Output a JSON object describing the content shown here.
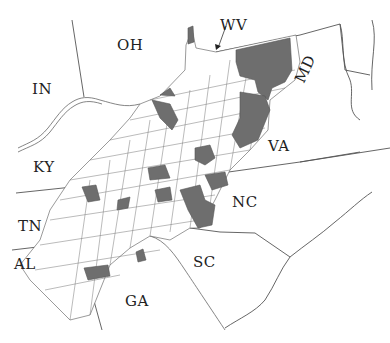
{
  "map": {
    "type": "county map of the Appalachian region",
    "highlight_color": "#6e6e6e",
    "county_fill": "#ffffff",
    "line_color": "#555555",
    "states": [
      {
        "abbr": "OH",
        "x": 117,
        "y": 36
      },
      {
        "abbr": "WV",
        "x": 220,
        "y": 16
      },
      {
        "abbr": "IN",
        "x": 32,
        "y": 80
      },
      {
        "abbr": "MD",
        "x": 296,
        "y": 58
      },
      {
        "abbr": "KY",
        "x": 33,
        "y": 158
      },
      {
        "abbr": "VA",
        "x": 268,
        "y": 137
      },
      {
        "abbr": "NC",
        "x": 232,
        "y": 193
      },
      {
        "abbr": "TN",
        "x": 18,
        "y": 217
      },
      {
        "abbr": "SC",
        "x": 193,
        "y": 253
      },
      {
        "abbr": "AL",
        "x": 14,
        "y": 255
      },
      {
        "abbr": "GA",
        "x": 125,
        "y": 292
      }
    ],
    "annotation": {
      "label": "WV",
      "arrow": "pointer to WV boundary"
    }
  }
}
